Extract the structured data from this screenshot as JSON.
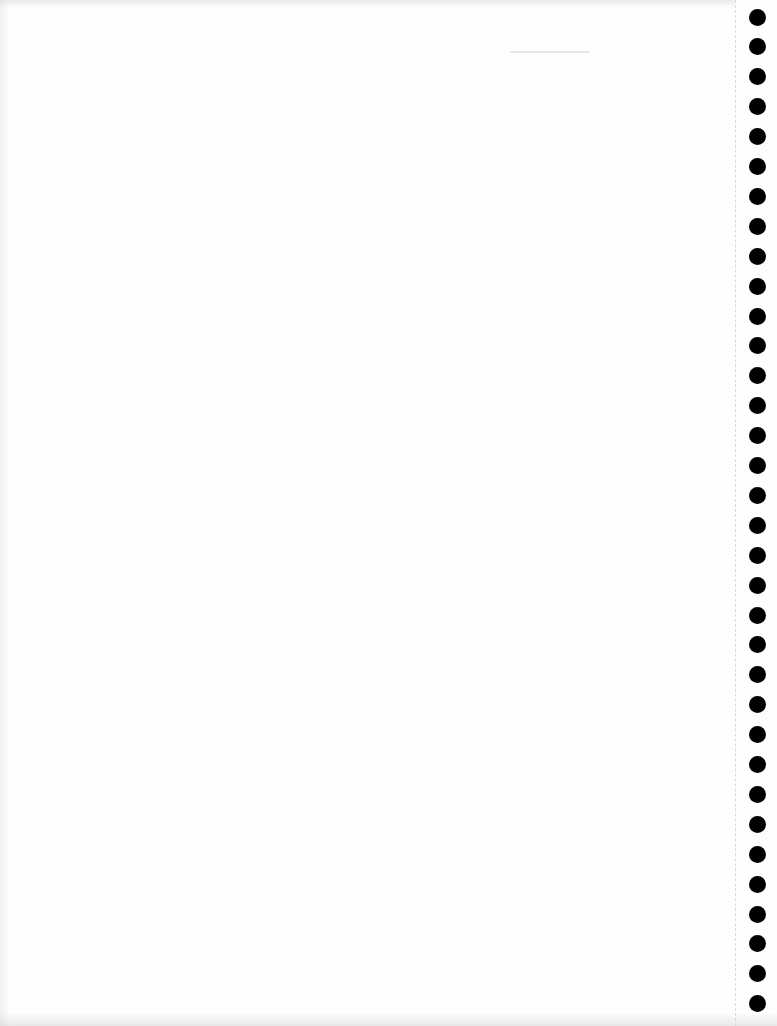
{
  "page": {
    "type": "blank-continuous-form-paper",
    "background_color": "#fefefe",
    "content_text": ""
  },
  "tractor_feed": {
    "side": "right",
    "perforation_x": 735,
    "hole_color": "#000000",
    "hole_diameter": 17,
    "hole_center_x": 757,
    "first_hole_center_y": 17,
    "hole_spacing": 29.9,
    "hole_count": 34
  }
}
